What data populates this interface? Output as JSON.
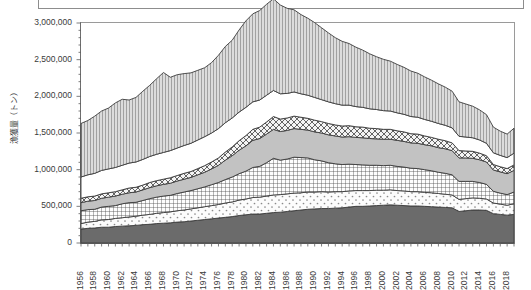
{
  "figure": {
    "ylabel": "漁獲量（トン）",
    "yticks": [
      "0",
      "500,000",
      "1,000,000",
      "1,500,000",
      "2,000,000",
      "2,500,000",
      "3,000,000"
    ],
    "xticks": [
      "1956",
      "1958",
      "1960",
      "1962",
      "1964",
      "1966",
      "1968",
      "1970",
      "1972",
      "1974",
      "1976",
      "1978",
      "1980",
      "1982",
      "1984",
      "1986",
      "1988",
      "1990",
      "1992",
      "1994",
      "1996",
      "1998",
      "2000",
      "2002",
      "2004",
      "2006",
      "2008",
      "2010",
      "2012",
      "2014",
      "2016",
      "2018"
    ],
    "colors": {
      "series1": "#6b6b6b",
      "series2": "#fbfbfb",
      "series3": "#fdfdfd",
      "series4": "#c2c2c2",
      "series5": "#f2f2f2",
      "series6": "#ffffff",
      "series7": "#d7d7d7",
      "axis": "#6e6e6e",
      "text": "#3a3a3a",
      "frame": "#8d8d8d"
    }
  },
  "chart_data": {
    "type": "area",
    "title": "",
    "subtitle": "",
    "xlabel": "",
    "ylabel": "漁獲量（トン）",
    "ylim": [
      0,
      3000000
    ],
    "xlim": [
      1956,
      2019
    ],
    "ytick_interval": 500000,
    "xtick_interval": 2,
    "grid": false,
    "legend": "none",
    "stacked": true,
    "x": [
      1956,
      1957,
      1958,
      1959,
      1960,
      1961,
      1962,
      1963,
      1964,
      1965,
      1966,
      1967,
      1968,
      1969,
      1970,
      1971,
      1972,
      1973,
      1974,
      1975,
      1976,
      1977,
      1978,
      1979,
      1980,
      1981,
      1982,
      1983,
      1984,
      1985,
      1986,
      1987,
      1988,
      1989,
      1990,
      1991,
      1992,
      1993,
      1994,
      1995,
      1996,
      1997,
      1998,
      1999,
      2000,
      2001,
      2002,
      2003,
      2004,
      2005,
      2006,
      2007,
      2008,
      2009,
      2010,
      2011,
      2012,
      2013,
      2014,
      2015,
      2016,
      2017,
      2018,
      2019
    ],
    "series": [
      {
        "name": "series1",
        "pattern": "solid-dark-gray",
        "color": "#6b6b6b",
        "values": [
          190000,
          200000,
          205000,
          215000,
          215000,
          225000,
          230000,
          235000,
          240000,
          250000,
          255000,
          265000,
          270000,
          275000,
          285000,
          290000,
          300000,
          310000,
          320000,
          330000,
          340000,
          350000,
          360000,
          375000,
          385000,
          395000,
          395000,
          405000,
          415000,
          420000,
          430000,
          440000,
          450000,
          460000,
          465000,
          470000,
          470000,
          475000,
          480000,
          490000,
          500000,
          500000,
          505000,
          510000,
          515000,
          520000,
          515000,
          510000,
          505000,
          505000,
          500000,
          495000,
          490000,
          485000,
          480000,
          430000,
          440000,
          450000,
          450000,
          445000,
          400000,
          390000,
          380000,
          390000
        ]
      },
      {
        "name": "series2",
        "pattern": "sparse-dots",
        "color": "#fbfbfb",
        "values": [
          75000,
          85000,
          90000,
          100000,
          105000,
          110000,
          115000,
          120000,
          125000,
          130000,
          135000,
          140000,
          145000,
          150000,
          155000,
          160000,
          165000,
          170000,
          175000,
          180000,
          185000,
          195000,
          200000,
          210000,
          215000,
          225000,
          230000,
          235000,
          240000,
          240000,
          240000,
          240000,
          235000,
          235000,
          230000,
          230000,
          225000,
          225000,
          220000,
          220000,
          215000,
          215000,
          210000,
          210000,
          205000,
          205000,
          200000,
          200000,
          195000,
          195000,
          190000,
          190000,
          185000,
          180000,
          175000,
          165000,
          165000,
          165000,
          160000,
          155000,
          145000,
          140000,
          135000,
          145000
        ]
      },
      {
        "name": "series3",
        "pattern": "fine-grid-crosshatch",
        "color": "#fdfdfd",
        "values": [
          175000,
          170000,
          165000,
          175000,
          180000,
          175000,
          190000,
          195000,
          190000,
          200000,
          215000,
          220000,
          225000,
          225000,
          235000,
          245000,
          250000,
          260000,
          270000,
          285000,
          300000,
          320000,
          340000,
          360000,
          380000,
          410000,
          420000,
          455000,
          500000,
          470000,
          475000,
          490000,
          480000,
          465000,
          440000,
          420000,
          400000,
          380000,
          370000,
          365000,
          355000,
          350000,
          345000,
          340000,
          335000,
          335000,
          330000,
          325000,
          320000,
          315000,
          310000,
          300000,
          290000,
          285000,
          275000,
          245000,
          235000,
          225000,
          215000,
          200000,
          160000,
          150000,
          145000,
          160000
        ]
      },
      {
        "name": "series4",
        "pattern": "solid-light-gray",
        "color": "#c2c2c2",
        "values": [
          110000,
          115000,
          120000,
          120000,
          125000,
          130000,
          130000,
          135000,
          140000,
          145000,
          150000,
          155000,
          160000,
          165000,
          170000,
          175000,
          180000,
          190000,
          200000,
          215000,
          235000,
          265000,
          290000,
          320000,
          345000,
          370000,
          380000,
          390000,
          395000,
          390000,
          390000,
          390000,
          385000,
          380000,
          380000,
          380000,
          380000,
          380000,
          375000,
          375000,
          370000,
          370000,
          365000,
          360000,
          360000,
          355000,
          355000,
          350000,
          345000,
          345000,
          340000,
          340000,
          335000,
          335000,
          330000,
          320000,
          320000,
          315000,
          310000,
          305000,
          290000,
          290000,
          285000,
          295000
        ]
      },
      {
        "name": "series5",
        "pattern": "diagonal-hatch",
        "color": "#f2f2f2",
        "values": [
          60000,
          60000,
          60000,
          60000,
          60000,
          60000,
          60000,
          65000,
          65000,
          65000,
          70000,
          70000,
          70000,
          75000,
          75000,
          80000,
          80000,
          85000,
          90000,
          95000,
          100000,
          110000,
          120000,
          130000,
          140000,
          150000,
          155000,
          165000,
          175000,
          170000,
          170000,
          170000,
          165000,
          160000,
          160000,
          155000,
          155000,
          150000,
          150000,
          150000,
          145000,
          145000,
          140000,
          140000,
          135000,
          135000,
          130000,
          130000,
          125000,
          125000,
          120000,
          115000,
          115000,
          110000,
          105000,
          100000,
          95000,
          95000,
          90000,
          85000,
          75000,
          70000,
          70000,
          75000
        ]
      },
      {
        "name": "series6",
        "pattern": "white-blank",
        "color": "#ffffff",
        "values": [
          290000,
          300000,
          310000,
          320000,
          325000,
          330000,
          335000,
          340000,
          345000,
          350000,
          355000,
          360000,
          365000,
          370000,
          375000,
          380000,
          385000,
          390000,
          395000,
          395000,
          400000,
          400000,
          395000,
          390000,
          385000,
          375000,
          370000,
          365000,
          355000,
          345000,
          335000,
          330000,
          320000,
          315000,
          310000,
          300000,
          295000,
          290000,
          285000,
          280000,
          275000,
          270000,
          265000,
          260000,
          255000,
          250000,
          245000,
          240000,
          235000,
          230000,
          225000,
          220000,
          215000,
          210000,
          205000,
          195000,
          190000,
          185000,
          180000,
          170000,
          160000,
          155000,
          150000,
          160000
        ]
      },
      {
        "name": "series7",
        "pattern": "vertical-lines",
        "color": "#d7d7d7",
        "values": [
          730000,
          740000,
          780000,
          810000,
          830000,
          880000,
          900000,
          860000,
          880000,
          930000,
          970000,
          1030000,
          1090000,
          1000000,
          1000000,
          980000,
          960000,
          950000,
          940000,
          960000,
          1000000,
          1040000,
          1060000,
          1120000,
          1180000,
          1200000,
          1220000,
          1240000,
          1250000,
          1210000,
          1160000,
          1120000,
          1080000,
          1050000,
          1020000,
          980000,
          940000,
          900000,
          870000,
          840000,
          810000,
          780000,
          750000,
          720000,
          700000,
          680000,
          660000,
          640000,
          620000,
          600000,
          580000,
          560000,
          540000,
          520000,
          500000,
          470000,
          450000,
          430000,
          410000,
          390000,
          350000,
          330000,
          320000,
          340000
        ]
      }
    ]
  }
}
